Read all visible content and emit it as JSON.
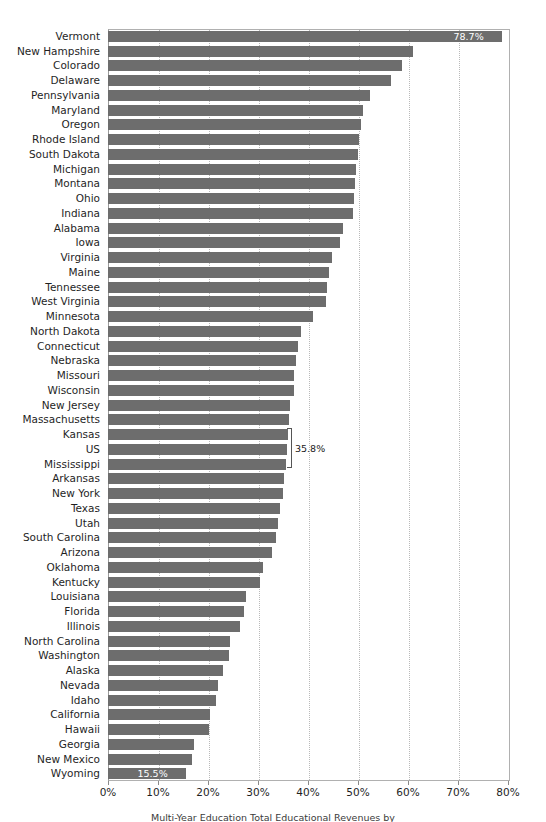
{
  "chart_data": {
    "type": "bar",
    "orientation": "horizontal",
    "title": "",
    "subtitle": "",
    "xlabel": "",
    "ylabel": "",
    "xlim": [
      0,
      80
    ],
    "xunit": "%",
    "grid": true,
    "gridlines_x": [
      0,
      10,
      20,
      30,
      40,
      50,
      60,
      70,
      80
    ],
    "legend": "none",
    "bar_color": "#6d6d6d",
    "x_tick_labels": [
      "0%",
      "10%",
      "20%",
      "30%",
      "40%",
      "50%",
      "60%",
      "70%",
      "80%"
    ],
    "x_tick_values": [
      0,
      10,
      20,
      30,
      40,
      50,
      60,
      70,
      80
    ],
    "categories": [
      "Vermont",
      "New Hampshire",
      "Colorado",
      "Delaware",
      "Pennsylvania",
      "Maryland",
      "Oregon",
      "Rhode Island",
      "South Dakota",
      "Michigan",
      "Montana",
      "Ohio",
      "Indiana",
      "Alabama",
      "Iowa",
      "Virginia",
      "Maine",
      "Tennessee",
      "West Virginia",
      "Minnesota",
      "North Dakota",
      "Connecticut",
      "Nebraska",
      "Missouri",
      "Wisconsin",
      "New Jersey",
      "Massachusetts",
      "Kansas",
      "US",
      "Mississippi",
      "Arkansas",
      "New York",
      "Texas",
      "Utah",
      "South Carolina",
      "Arizona",
      "Oklahoma",
      "Kentucky",
      "Louisiana",
      "Florida",
      "Illinois",
      "North Carolina",
      "Washington",
      "Alaska",
      "Nevada",
      "Idaho",
      "California",
      "Hawaii",
      "Georgia",
      "New Mexico",
      "Wyoming"
    ],
    "values": [
      78.7,
      60.9,
      58.8,
      56.5,
      52.4,
      50.9,
      50.5,
      50.1,
      50.0,
      49.5,
      49.3,
      49.1,
      48.9,
      46.9,
      46.3,
      44.8,
      44.2,
      43.8,
      43.6,
      41.0,
      38.5,
      38.0,
      37.5,
      37.2,
      37.1,
      36.4,
      36.2,
      36.0,
      35.8,
      35.5,
      35.2,
      34.9,
      34.4,
      34.0,
      33.5,
      32.7,
      31.0,
      30.4,
      27.6,
      27.1,
      26.3,
      24.4,
      24.2,
      23.0,
      22.0,
      21.6,
      20.3,
      20.1,
      17.2,
      16.8,
      15.5
    ],
    "labeled_points": [
      {
        "category": "Vermont",
        "value": 78.7,
        "label": "78.7%",
        "placement": "inside"
      },
      {
        "category": "US",
        "value": 35.8,
        "label": "35.8%",
        "placement": "callout"
      },
      {
        "category": "Wyoming",
        "value": 15.5,
        "label": "15.5%",
        "placement": "inside"
      }
    ]
  },
  "footer": {
    "caption": "Multi-Year Education Total Educational Revenues by"
  }
}
